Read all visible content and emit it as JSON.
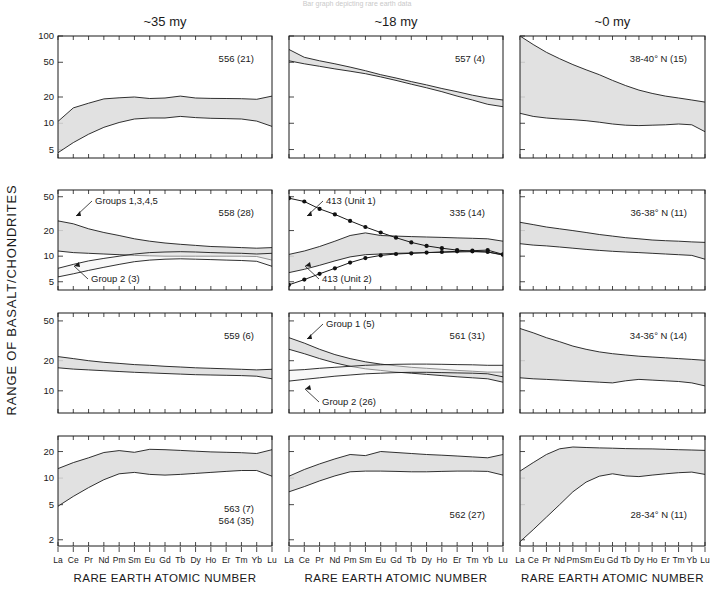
{
  "figure": {
    "top_cutoff_text": "Bar graph depicting rare earth data",
    "y_axis_title": "RANGE OF BASALT/CHONDRITES",
    "x_axis_title": "RARE EARTH ATOMIC NUMBER",
    "column_titles": [
      "~35 my",
      "~18 my",
      "~0 my"
    ],
    "elements": [
      "La",
      "Ce",
      "Pr",
      "Nd",
      "Pm",
      "Sm",
      "Eu",
      "Gd",
      "Tb",
      "Dy",
      "Ho",
      "Er",
      "Tm",
      "Yb",
      "Lu"
    ],
    "row_tick_labels": [
      [
        "100",
        "50",
        "20",
        "10",
        "5"
      ],
      [
        "50",
        "20",
        "10",
        "5"
      ],
      [
        "50",
        "20",
        "10"
      ],
      [
        "20",
        "10",
        "5",
        "2"
      ]
    ],
    "colors": {
      "band_fill": "#dcdcdc",
      "band_stroke": "#1a1a1a",
      "text": "#1a1a1a",
      "background": "#ffffff"
    }
  },
  "chart_data": {
    "type": "area",
    "xlabel": "RARE EARTH ATOMIC NUMBER",
    "ylabel": "RANGE OF BASALT/CHONDRITES",
    "x": [
      "La",
      "Ce",
      "Pr",
      "Nd",
      "Pm",
      "Sm",
      "Eu",
      "Gd",
      "Tb",
      "Dy",
      "Ho",
      "Er",
      "Tm",
      "Yb",
      "Lu"
    ],
    "grid": false,
    "legend": "none",
    "yscale": "log",
    "columns": [
      {
        "label": "~35 my"
      },
      {
        "label": "~18 my"
      },
      {
        "label": "~0 my"
      }
    ],
    "rows": [
      {
        "ylim": [
          4,
          100
        ],
        "ticks": [
          100,
          50,
          20,
          10,
          5
        ]
      },
      {
        "ylim": [
          4,
          60
        ],
        "ticks": [
          50,
          20,
          10,
          5
        ]
      },
      {
        "ylim": [
          6,
          60
        ],
        "ticks": [
          50,
          20,
          10
        ]
      },
      {
        "ylim": [
          1.7,
          30
        ],
        "ticks": [
          20,
          10,
          5,
          2
        ]
      }
    ],
    "panels": [
      {
        "row": 0,
        "col": 0,
        "label": "556 (21)",
        "bands": [
          {
            "name": "range",
            "upper": [
              10.5,
              15,
              17,
              19,
              19.6,
              20,
              19.2,
              19.5,
              20.5,
              19.5,
              19.3,
              19.2,
              19.1,
              18.8,
              20.5
            ],
            "lower": [
              4.6,
              6.0,
              7.5,
              9.0,
              10.2,
              11.2,
              11.5,
              11.5,
              12.0,
              11.6,
              11.4,
              11.3,
              11.2,
              10.6,
              9.2
            ]
          }
        ],
        "series": [],
        "annotations": []
      },
      {
        "row": 0,
        "col": 1,
        "label": "557 (4)",
        "bands": [
          {
            "name": "range",
            "upper": [
              70,
              57,
              52,
              48,
              44,
              40,
              36,
              33,
              30,
              27.5,
              25,
              23,
              21,
              19.5,
              18.5
            ],
            "lower": [
              52,
              48,
              45,
              42,
              39.5,
              37,
              34,
              31,
              28,
              25.5,
              23,
              20.5,
              18.5,
              16.5,
              15.5
            ]
          }
        ],
        "series": [],
        "annotations": []
      },
      {
        "row": 0,
        "col": 2,
        "label": "38-40° N (15)",
        "bands": [
          {
            "name": "range",
            "upper": [
              100,
              80,
              65,
              55,
              47,
              41,
              36,
              31,
              27,
              24,
              22,
              20.5,
              19.5,
              18.5,
              17.5
            ],
            "lower": [
              13,
              12,
              11.5,
              11.2,
              11,
              10.7,
              10.3,
              9.8,
              9.5,
              9.4,
              9.5,
              9.6,
              9.8,
              9.6,
              8.0
            ]
          }
        ],
        "series": [],
        "annotations": []
      },
      {
        "row": 1,
        "col": 0,
        "label": "558 (28)",
        "bands": [
          {
            "name": "Groups 1,3,4,5",
            "upper": [
              26,
              24,
              21,
              19,
              17.5,
              16,
              15,
              14.3,
              13.8,
              13.4,
              13.0,
              12.8,
              12.6,
              12.4,
              12.6
            ],
            "lower": [
              11.5,
              11.0,
              10.8,
              10.6,
              10.4,
              10.2,
              10.1,
              10.0,
              10.0,
              10.0,
              10.0,
              10.0,
              10.0,
              9.9,
              9.0
            ]
          },
          {
            "name": "Group 2 (3)",
            "upper": [
              7.2,
              8.0,
              8.8,
              9.4,
              10.0,
              10.6,
              11.0,
              11.2,
              11.3,
              11.2,
              11.0,
              10.9,
              10.8,
              10.6,
              10.8
            ],
            "lower": [
              5.7,
              6.2,
              6.8,
              7.4,
              8.0,
              8.6,
              9.0,
              9.2,
              9.3,
              9.2,
              9.1,
              9.0,
              8.9,
              8.7,
              7.6
            ]
          }
        ],
        "series": [],
        "annotations": [
          {
            "text": "Groups 1,3,4,5",
            "anchor": "upper-left"
          },
          {
            "text": "Group 2 (3)",
            "anchor": "lower-left"
          }
        ]
      },
      {
        "row": 1,
        "col": 1,
        "label": "335 (14)",
        "bands": [
          {
            "name": "range",
            "upper": [
              10.5,
              11.5,
              13.0,
              15.0,
              17.5,
              18.8,
              17.5,
              17.2,
              17.0,
              16.8,
              16.6,
              16.4,
              16.2,
              16.0,
              15.0
            ],
            "lower": [
              6.4,
              7.0,
              7.8,
              8.8,
              9.8,
              10.4,
              10.6,
              10.8,
              10.9,
              11.0,
              11.1,
              11.2,
              11.3,
              11.2,
              10.3
            ]
          }
        ],
        "series": [
          {
            "name": "413 (Unit 1)",
            "marker": "filled-circle",
            "values": [
              48,
              44,
              36,
              31,
              26,
              22,
              19,
              16.5,
              14.5,
              13.2,
              12.4,
              11.8,
              11.4,
              11.2,
              10.4
            ]
          },
          {
            "name": "413 (Unit 2)",
            "marker": "filled-circle",
            "values": [
              4.6,
              5.3,
              6.2,
              7.2,
              8.4,
              9.5,
              10.2,
              10.6,
              10.8,
              11.0,
              11.2,
              11.4,
              11.6,
              11.8,
              10.5
            ]
          }
        ],
        "annotations": [
          {
            "text": "413 (Unit 1)",
            "anchor": "upper-left"
          },
          {
            "text": "413 (Unit 2)",
            "anchor": "lower-left"
          }
        ]
      },
      {
        "row": 1,
        "col": 2,
        "label": "36-38° N (11)",
        "bands": [
          {
            "name": "range",
            "upper": [
              25,
              23.5,
              22,
              21,
              20,
              19,
              18,
              17.2,
              16.5,
              16,
              15.5,
              15.2,
              15,
              14.7,
              14.5
            ],
            "lower": [
              14,
              13.5,
              13.2,
              12.8,
              12.4,
              12.0,
              11.7,
              11.4,
              11.2,
              11.0,
              10.8,
              10.6,
              10.4,
              10.2,
              9.2
            ]
          }
        ],
        "series": [],
        "annotations": []
      },
      {
        "row": 2,
        "col": 0,
        "label": "559 (6)",
        "bands": [
          {
            "name": "range",
            "upper": [
              22,
              21,
              20,
              19.3,
              18.8,
              18.3,
              18.0,
              17.6,
              17.3,
              17.0,
              16.8,
              16.6,
              16.4,
              16.2,
              16.4
            ],
            "lower": [
              17,
              16.5,
              16.2,
              15.9,
              15.6,
              15.3,
              15.1,
              14.9,
              14.7,
              14.5,
              14.4,
              14.3,
              14.2,
              14.0,
              13.2
            ]
          }
        ],
        "series": [],
        "annotations": []
      },
      {
        "row": 2,
        "col": 1,
        "label": "561 (31)",
        "bands": [
          {
            "name": "Group 1 (5)",
            "upper": [
              34,
              30,
              26,
              23,
              21,
              19.5,
              18.5,
              17.8,
              17.2,
              16.8,
              16.4,
              16.0,
              15.7,
              15.4,
              15.4
            ],
            "lower": [
              26,
              23.5,
              21,
              19,
              17.6,
              16.6,
              16.0,
              15.4,
              15.0,
              14.6,
              14.2,
              13.8,
              13.5,
              13.2,
              12.2
            ]
          },
          {
            "name": "Group 2 (26)",
            "upper": [
              16,
              16.3,
              16.8,
              17.2,
              17.6,
              18.0,
              18.2,
              18.4,
              18.5,
              18.5,
              18.4,
              18.3,
              18.2,
              18.0,
              18.0
            ],
            "lower": [
              12.5,
              13.0,
              13.5,
              14.0,
              14.4,
              14.8,
              15.0,
              15.2,
              15.3,
              15.3,
              15.2,
              15.1,
              15.0,
              14.8,
              13.8
            ]
          }
        ],
        "series": [],
        "annotations": [
          {
            "text": "Group 1 (5)",
            "anchor": "upper-left"
          },
          {
            "text": "Group 2 (26)",
            "anchor": "lower-left"
          }
        ]
      },
      {
        "row": 2,
        "col": 2,
        "label": "34-36° N (14)",
        "bands": [
          {
            "name": "range",
            "upper": [
              42,
              38,
              34,
              31,
              28,
              26,
              24.5,
              23.5,
              22.8,
              22.2,
              21.8,
              21.4,
              21.0,
              20.6,
              20.2
            ],
            "lower": [
              13.5,
              13.2,
              13.0,
              12.8,
              12.6,
              12.4,
              12.2,
              12.0,
              12.6,
              13.0,
              12.8,
              12.6,
              12.4,
              12.0,
              11.2
            ]
          }
        ],
        "series": [],
        "annotations": []
      },
      {
        "row": 3,
        "col": 0,
        "label": "563 (7)\n564 (35)",
        "label_lines": [
          "563 (7)",
          "564 (35)"
        ],
        "bands": [
          {
            "name": "range",
            "upper": [
              12.8,
              15,
              17,
              19.5,
              20.5,
              19.6,
              21.2,
              21.0,
              20.6,
              20.2,
              19.8,
              19.6,
              19.4,
              19.0,
              21.0
            ],
            "lower": [
              4.8,
              6.2,
              7.8,
              9.6,
              11.2,
              11.6,
              11.0,
              10.8,
              11.0,
              11.3,
              11.6,
              11.9,
              12.2,
              12.2,
              10.5
            ]
          }
        ],
        "series": [],
        "annotations": []
      },
      {
        "row": 3,
        "col": 1,
        "label": "562 (27)",
        "bands": [
          {
            "name": "range",
            "upper": [
              10.5,
              12.5,
              14.5,
              16.5,
              18.5,
              18.0,
              20.0,
              19.5,
              19.0,
              18.5,
              18.2,
              17.8,
              17.4,
              17.0,
              18.5
            ],
            "lower": [
              7.0,
              8.0,
              9.3,
              10.6,
              11.8,
              12.0,
              12.0,
              11.9,
              11.8,
              11.8,
              11.9,
              12.0,
              12.0,
              11.9,
              10.8
            ]
          }
        ],
        "series": [],
        "annotations": []
      },
      {
        "row": 3,
        "col": 2,
        "label": "28-34° N (11)",
        "bands": [
          {
            "name": "range",
            "upper": [
              12.0,
              15.0,
              18.5,
              21.5,
              22.5,
              22.2,
              22.0,
              21.8,
              21.6,
              21.5,
              21.4,
              21.2,
              21.0,
              20.8,
              20.6
            ],
            "lower": [
              1.9,
              2.6,
              3.6,
              5.0,
              7.0,
              9.0,
              10.5,
              11.2,
              10.6,
              10.4,
              10.8,
              11.2,
              11.5,
              11.7,
              11.0
            ]
          }
        ],
        "series": [],
        "annotations": []
      }
    ]
  }
}
